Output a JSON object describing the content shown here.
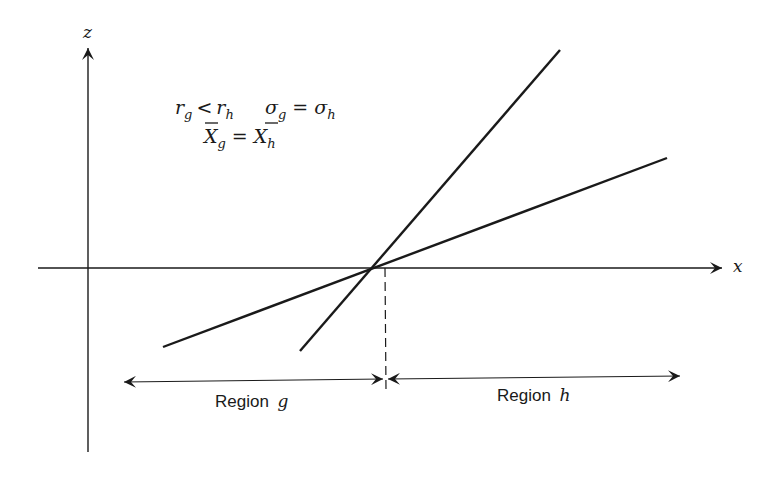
{
  "figure": {
    "axes": {
      "vertical_label": "z",
      "horizontal_label": "x"
    },
    "conditions": {
      "line1": {
        "left_var": "r",
        "left_sub": "g",
        "op": "<",
        "right_var": "r",
        "right_sub": "h"
      },
      "line1b": {
        "left_var": "σ",
        "left_sub": "g",
        "op": "=",
        "right_var": "σ",
        "right_sub": "h"
      },
      "line2": {
        "left_var": "X",
        "left_sub": "g",
        "op": "=",
        "right_var": "X",
        "right_sub": "h",
        "overbar": true
      }
    },
    "regions": [
      {
        "label": "Region",
        "var": "g"
      },
      {
        "label": "Region",
        "var": "h"
      }
    ],
    "lines": [
      {
        "name": "steep-line",
        "x1": 300,
        "y1": 351,
        "x2": 560,
        "y2": 50
      },
      {
        "name": "shallow-line",
        "x1": 163,
        "y1": 347,
        "x2": 667,
        "y2": 158
      }
    ],
    "intersection": {
      "x": 385,
      "y": 266
    },
    "colors": {
      "ink": "#1a1a1a",
      "background": "#ffffff"
    }
  }
}
